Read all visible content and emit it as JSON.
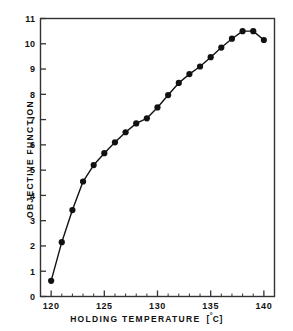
{
  "chart_data": {
    "type": "line",
    "title": "",
    "subtitle": "",
    "xlabel": "HOLDING  TEMPERATURE  [ °C ]",
    "xlabel_main": "HOLDING   TEMPERATURE",
    "xlabel_unit_open": "[",
    "xlabel_unit_deg": "°",
    "xlabel_unit_c": "C",
    "xlabel_unit_close": "]",
    "ylabel": "OBJECTIVE  FUNCTION",
    "xlim": [
      119.0,
      141.0
    ],
    "ylim": [
      0,
      11
    ],
    "x_major_ticks": [
      120,
      125,
      130,
      135,
      140
    ],
    "x_major_tick_labels": [
      "120",
      "125",
      "130",
      "135",
      "140"
    ],
    "x_minor_ticks": [
      121,
      122,
      123,
      124,
      126,
      127,
      128,
      129,
      131,
      132,
      133,
      134,
      136,
      137,
      138,
      139
    ],
    "y_ticks": [
      0,
      1,
      2,
      3,
      4,
      5,
      6,
      7,
      8,
      9,
      10,
      11
    ],
    "y_tick_labels": [
      "0",
      "1",
      "2",
      "3",
      "4",
      "5",
      "6",
      "7",
      "8",
      "9",
      "10",
      "11"
    ],
    "grid": false,
    "legend": false,
    "legend_position": "none",
    "marker": "filled-circle",
    "marker_color": "#111111",
    "line_color": "#111111",
    "frame_color": "#333333",
    "background_color": "#ffffff",
    "x": [
      120,
      121,
      122,
      123,
      124,
      125,
      126,
      127,
      128,
      129,
      130,
      131,
      132,
      133,
      134,
      135,
      136,
      137,
      138,
      139,
      140
    ],
    "values": [
      0.62,
      2.15,
      3.42,
      4.55,
      5.2,
      5.67,
      6.1,
      6.5,
      6.85,
      7.05,
      7.48,
      7.97,
      8.45,
      8.8,
      9.1,
      9.47,
      9.85,
      10.2,
      10.5,
      10.5,
      10.15
    ],
    "series": [
      {
        "name": "objective function",
        "values": [
          0.62,
          2.15,
          3.42,
          4.55,
          5.2,
          5.67,
          6.1,
          6.5,
          6.85,
          7.05,
          7.48,
          7.97,
          8.45,
          8.8,
          9.1,
          9.47,
          9.85,
          10.2,
          10.5,
          10.5,
          10.15
        ]
      }
    ]
  }
}
